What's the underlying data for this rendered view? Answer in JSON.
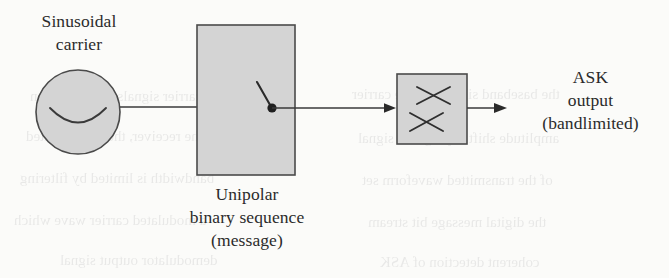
{
  "figure": {
    "background_color": "#fbfbf9",
    "ink_color": "#2b2b2b",
    "shape_fill_color": "#d4d4d4",
    "shape_stroke_color": "#4a4a4a"
  },
  "labels": {
    "carrier": "Sinusoidal\ncarrier",
    "carrier_line1": "Sinusoidal",
    "carrier_line2": "carrier",
    "message": "Unipolar\nbinary sequence\n(message)",
    "message_line1": "Unipolar",
    "message_line2": "binary sequence",
    "message_line3": "(message)",
    "output": "ASK\noutput\n(bandlimited)",
    "output_line1": "ASK",
    "output_line2": "output",
    "output_line3": "(bandlimited)"
  },
  "blocks": {
    "oscillator": {
      "name": "sinusoidal-carrier-oscillator",
      "shape": "circle",
      "symbol": "sine-wave-arc",
      "cx": 78,
      "cy": 112,
      "r": 42
    },
    "switch_block": {
      "name": "unipolar-binary-sequence-switch",
      "shape": "rectangle",
      "symbol": "spst-switch",
      "x": 197,
      "y": 25,
      "width": 98,
      "height": 150
    },
    "multiplier": {
      "name": "multiplier",
      "shape": "rectangle",
      "symbol": "double-cross-multiplier",
      "x": 397,
      "y": 74,
      "width": 70,
      "height": 70
    }
  },
  "connections": [
    {
      "name": "carrier-to-switch-wire",
      "from": "oscillator",
      "to": "switch_block",
      "arrow": false
    },
    {
      "name": "switch-to-multiplier-wire",
      "from": "switch_block",
      "to": "multiplier",
      "arrow": true
    },
    {
      "name": "multiplier-to-output-wire",
      "from": "multiplier",
      "to": "output",
      "arrow": true
    }
  ],
  "bleed_through_lines": [
    {
      "text": "of subcarrier signals in modulation",
      "x": 30,
      "y": 88
    },
    {
      "text": "the baseband signal and the carrier",
      "x": 352,
      "y": 86
    },
    {
      "text": "at the receiver, the demodulated",
      "x": 26,
      "y": 128
    },
    {
      "text": "amplitude shift keying of a signal",
      "x": 358,
      "y": 130
    },
    {
      "text": "bandwidth is limited by filtering",
      "x": 20,
      "y": 170
    },
    {
      "text": "of the transmitted waveform set",
      "x": 362,
      "y": 172
    },
    {
      "text": "a modulated carrier wave which",
      "x": 14,
      "y": 212
    },
    {
      "text": "the digital message bit stream",
      "x": 368,
      "y": 214
    },
    {
      "text": "demodulator output signal",
      "x": 60,
      "y": 252
    },
    {
      "text": "coherent detection of ASK",
      "x": 380,
      "y": 254
    }
  ]
}
